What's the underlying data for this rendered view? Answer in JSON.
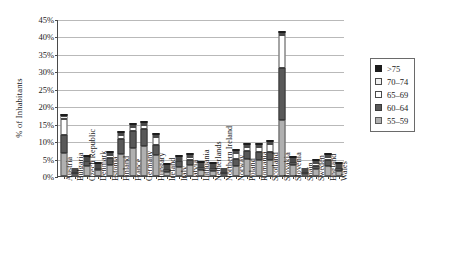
{
  "chart_data": {
    "type": "bar",
    "subtype": "stacked-bar",
    "title": "",
    "xlabel": "",
    "ylabel": "% of Inhabitants",
    "ylim": [
      0,
      45
    ],
    "ytick_labels": [
      "0%",
      "5%",
      "10%",
      "15%",
      "20%",
      "25%",
      "30%",
      "35%",
      "40%",
      "45%"
    ],
    "ytick_values": [
      0,
      5,
      10,
      15,
      20,
      25,
      30,
      35,
      40,
      45
    ],
    "grid": "horizontal",
    "legend_position": "right",
    "categories": [
      "Austria",
      "Bulgaria",
      "Czech Republic",
      "Denmark",
      "Estonia",
      "Finland",
      "France",
      "Germany",
      "Hungary",
      "Ireland",
      "Italy",
      "Latvia",
      "Lithuania",
      "Netherlands",
      "Northern Ireland",
      "Norway",
      "Poland",
      "Romania",
      "Scotland",
      "Slovakia",
      "Slovenia",
      "Spain",
      "Sweden",
      "England",
      "Wales"
    ],
    "series": [
      {
        "name": "55–59",
        "color": "#b0b0b0",
        "values": [
          6.5,
          0.6,
          3.0,
          1.7,
          3.2,
          6.4,
          8.0,
          8.5,
          5.9,
          1.2,
          2.5,
          3.1,
          1.7,
          1.4,
          0.5,
          3.0,
          5.0,
          4.6,
          4.6,
          16.0,
          3.2,
          0.3,
          2.0,
          2.8,
          1.4
        ]
      },
      {
        "name": "60–64",
        "color": "#595959",
        "values": [
          5.3,
          0.3,
          1.3,
          0.6,
          2.0,
          4.3,
          4.8,
          4.9,
          3.0,
          0.7,
          1.7,
          1.6,
          1.0,
          0.8,
          0.3,
          2.0,
          2.2,
          2.2,
          2.2,
          15.0,
          0.8,
          0.2,
          1.0,
          1.7,
          0.9
        ]
      },
      {
        "name": "65–69",
        "color": "#ffffff",
        "values": [
          4.6,
          0.2,
          0.6,
          0.4,
          0.9,
          1.2,
          1.2,
          1.2,
          2.2,
          0.5,
          0.8,
          0.7,
          0.5,
          0.4,
          0.2,
          1.5,
          1.0,
          1.6,
          2.3,
          9.5,
          0.5,
          0.1,
          0.6,
          1.0,
          0.5
        ]
      },
      {
        "name": "70–74",
        "color": "#f0f0f0",
        "values": [
          0.8,
          0.1,
          0.2,
          0.1,
          0.3,
          0.4,
          0.4,
          0.4,
          0.4,
          0.2,
          0.3,
          0.2,
          0.2,
          0.2,
          0.1,
          0.4,
          0.3,
          0.4,
          0.5,
          0.6,
          0.2,
          0.1,
          0.2,
          0.3,
          0.2
        ]
      },
      {
        "name": ">75",
        "color": "#1c1c1c",
        "values": [
          0.3,
          0.0,
          0.1,
          0.1,
          0.1,
          0.2,
          0.2,
          0.2,
          0.2,
          0.1,
          0.1,
          0.1,
          0.1,
          0.1,
          0.0,
          0.2,
          0.1,
          0.2,
          0.2,
          0.4,
          0.1,
          0.0,
          0.1,
          0.1,
          0.1
        ]
      }
    ]
  },
  "legend": {
    "items": [
      {
        "label": ">75",
        "swatch": "#1c1c1c",
        "border": "#1c1c1c"
      },
      {
        "label": "70–74",
        "swatch": "#f0f0f0",
        "border": "#4a4a4a"
      },
      {
        "label": "65–69",
        "swatch": "#ffffff",
        "border": "#4a4a4a"
      },
      {
        "label": "60–64",
        "swatch": "#595959",
        "border": "#3a3a3a"
      },
      {
        "label": "55–59",
        "swatch": "#b0b0b0",
        "border": "#5a5a5a"
      }
    ]
  },
  "axis": {
    "y_title": "% of Inhabitants"
  }
}
